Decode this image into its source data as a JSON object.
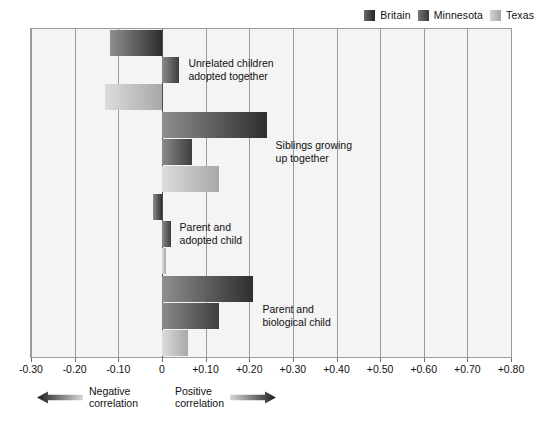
{
  "legend": {
    "items": [
      {
        "label": "Britain",
        "key": "britain",
        "color": "#2e2e2e"
      },
      {
        "label": "Minnesota",
        "key": "minnesota",
        "color": "#3e3e3e"
      },
      {
        "label": "Texas",
        "key": "texas",
        "color": "#a8a8a8"
      }
    ]
  },
  "annotations": {
    "negative": {
      "line1": "Negative",
      "line2": "correlation"
    },
    "positive": {
      "line1": "Positive",
      "line2": "correlation"
    }
  },
  "axis_labels": [
    "-0.30",
    "-0.20",
    "-0.10",
    "0",
    "+0.10",
    "+0.20",
    "+0.30",
    "+0.40",
    "+0.50",
    "+0.60",
    "+0.70",
    "+0.80"
  ],
  "chart_data": {
    "type": "bar",
    "orientation": "horizontal",
    "title": "",
    "xlabel": "Correlation",
    "ylabel": "",
    "xlim": [
      -0.3,
      0.8
    ],
    "xticks": [
      -0.3,
      -0.2,
      -0.1,
      0,
      0.1,
      0.2,
      0.3,
      0.4,
      0.5,
      0.6,
      0.7,
      0.8
    ],
    "xticklabels": [
      "-0.30",
      "-0.20",
      "-0.10",
      "0",
      "+0.10",
      "+0.20",
      "+0.30",
      "+0.40",
      "+0.50",
      "+0.60",
      "+0.70",
      "+0.80"
    ],
    "grid": true,
    "legend_position": "top-right",
    "categories": [
      "Unrelated children adopted together",
      "Siblings growing up together",
      "Parent and adopted child",
      "Parent and biological child"
    ],
    "category_labels": [
      {
        "line1": "Unrelated children",
        "line2": "adopted together"
      },
      {
        "line1": "Siblings growing",
        "line2": "up together"
      },
      {
        "line1": "Parent and",
        "line2": "adopted child"
      },
      {
        "line1": "Parent and",
        "line2": "biological child"
      }
    ],
    "series": [
      {
        "name": "Britain",
        "values": [
          -0.12,
          0.24,
          -0.02,
          0.21
        ]
      },
      {
        "name": "Minnesota",
        "values": [
          0.04,
          0.07,
          0.02,
          0.13
        ]
      },
      {
        "name": "Texas",
        "values": [
          -0.13,
          0.13,
          0.01,
          0.06
        ]
      }
    ]
  }
}
